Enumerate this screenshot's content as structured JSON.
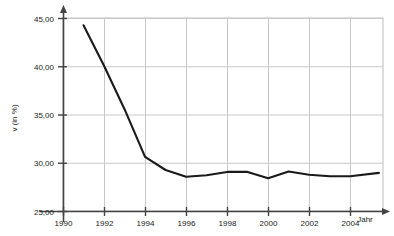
{
  "chart_data": {
    "type": "line",
    "title": "",
    "subtitle": "",
    "xlabel": "Jahr",
    "ylabel": "v (in %)",
    "xlim": [
      1990,
      2005.6
    ],
    "ylim": [
      25.0,
      45.0
    ],
    "grid": true,
    "legend": false,
    "legend_position": "none",
    "x_tick_labels": [
      "1990",
      "1992",
      "1994",
      "1996",
      "1998",
      "2000",
      "2002",
      "2004"
    ],
    "x_ticks": [
      1990,
      1992,
      1994,
      1996,
      1998,
      2000,
      2002,
      2004
    ],
    "y_tick_labels": [
      "25,00",
      "30,00",
      "35,00",
      "40,00",
      "45,00"
    ],
    "y_ticks": [
      25.0,
      30.0,
      35.0,
      40.0,
      45.0
    ],
    "series": [
      {
        "name": "v",
        "color": "#1a1a1a",
        "x": [
          1991.0,
          1992.0,
          1993.0,
          1994.0,
          1995.0,
          1996.0,
          1997.0,
          1998.0,
          1999.0,
          2000.0,
          2001.0,
          2002.0,
          2003.0,
          2004.0,
          2005.4
        ],
        "values": [
          44.25,
          40.05,
          35.55,
          30.6,
          29.25,
          28.55,
          28.7,
          29.05,
          29.05,
          28.4,
          29.1,
          28.75,
          28.6,
          28.6,
          28.95
        ]
      }
    ]
  },
  "axis": {
    "y_title": "v (in %)",
    "x_title": "Jahr",
    "ticks_y": [
      "45,00",
      "40,00",
      "35,00",
      "30,00",
      "25,00"
    ],
    "ticks_x": [
      "1990",
      "1992",
      "1994",
      "1996",
      "1998",
      "2000",
      "2002",
      "2004"
    ]
  },
  "colors": {
    "line": "#1a1a1a",
    "axis": "#444444",
    "grid": "#c9c9c9",
    "plot_border": "#bdbdbd",
    "background": "#ffffff",
    "text": "#1a1a1a"
  }
}
